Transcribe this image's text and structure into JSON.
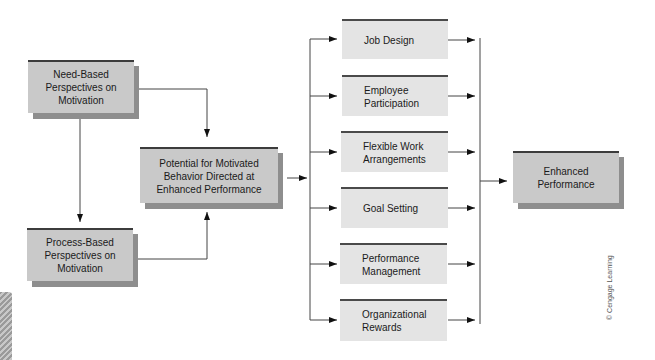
{
  "diagram": {
    "sources": [
      {
        "id": "need",
        "label": "Need-Based\nPerspectives on\nMotivation"
      },
      {
        "id": "process",
        "label": "Process-Based\nPerspectives on\nMotivation"
      }
    ],
    "center": {
      "label": "Potential for Motivated\nBehavior Directed at\nEnhanced Performance"
    },
    "methods": [
      {
        "label": "Job Design"
      },
      {
        "label": "Employee\nParticipation"
      },
      {
        "label": "Flexible Work\nArrangements"
      },
      {
        "label": "Goal Setting"
      },
      {
        "label": "Performance\nManagement"
      },
      {
        "label": "Organizational\nRewards"
      }
    ],
    "outcome": {
      "label": "Enhanced\nPerformance"
    },
    "credit": "© Cengage Learning",
    "colors": {
      "shadowed_box": "#c9c9c9",
      "flat_box": "#e4e4e4",
      "shadow": "#8e8e8e",
      "top_rule": "#3c3c3c",
      "line": "#333333"
    }
  }
}
